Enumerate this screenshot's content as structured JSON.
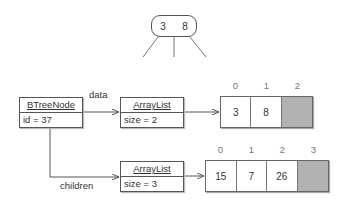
{
  "tree_node": {
    "keys": [
      "3",
      "8"
    ]
  },
  "btree_node": {
    "class_name": "BTreeNode",
    "field": "id = 37"
  },
  "edges": {
    "data_label": "data",
    "children_label": "children"
  },
  "data_list": {
    "class_name": "ArrayList",
    "field": "size = 2",
    "array": {
      "indices": [
        "0",
        "1",
        "2"
      ],
      "cells": [
        "3",
        "8",
        ""
      ]
    }
  },
  "children_list": {
    "class_name": "ArrayList",
    "field": "size = 3",
    "array": {
      "indices": [
        "0",
        "1",
        "2",
        "3"
      ],
      "cells": [
        "15",
        "7",
        "26",
        ""
      ]
    }
  },
  "colors": {
    "empty_cell": "#b2b2b2",
    "stroke": "#555555"
  }
}
